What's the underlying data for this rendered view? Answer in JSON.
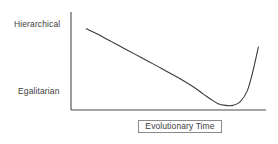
{
  "figure": {
    "background_color": "#ffffff",
    "line_color": "#3a3a3a",
    "text_color": "#3d3d3d",
    "box_border_color": "#8a8a8a"
  },
  "y_axis": {
    "top_label": "Hierarchical",
    "bottom_label": "Egalitarian"
  },
  "x_axis": {
    "title": "Evolutionary Time"
  },
  "chart_data": {
    "type": "line",
    "title": "",
    "xlabel": "Evolutionary Time",
    "ylabel": "",
    "ytick_labels": [
      "Egalitarian",
      "Hierarchical"
    ],
    "ytick_values": [
      0.18,
      0.9
    ],
    "xtick_labels": [],
    "grid": false,
    "legend": null,
    "xlim": [
      0,
      1
    ],
    "ylim": [
      0,
      1
    ],
    "series": [
      {
        "name": "Social structure over evolutionary time",
        "x": [
          0.04,
          0.1,
          0.18,
          0.26,
          0.34,
          0.42,
          0.48,
          0.55,
          0.62,
          0.68,
          0.72,
          0.76,
          0.8,
          0.84,
          0.88,
          0.92,
          0.95,
          0.98
        ],
        "y": [
          0.91,
          0.85,
          0.76,
          0.67,
          0.58,
          0.49,
          0.42,
          0.34,
          0.25,
          0.16,
          0.1,
          0.05,
          0.03,
          0.03,
          0.07,
          0.2,
          0.42,
          0.7
        ]
      }
    ],
    "annotations": [
      "Curve descends steeply from Hierarchical, flattens to a minimum near Egalitarian, then rises sharply at the end"
    ]
  }
}
